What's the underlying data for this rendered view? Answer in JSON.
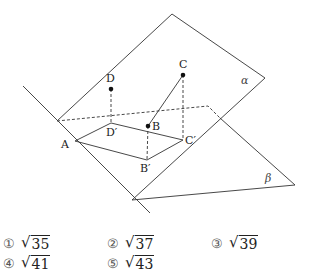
{
  "figure": {
    "planes": [
      {
        "name": "alpha",
        "label": "α"
      },
      {
        "name": "beta",
        "label": "β"
      }
    ],
    "points": [
      {
        "name": "A",
        "label": "A"
      },
      {
        "name": "B",
        "label": "B"
      },
      {
        "name": "C",
        "label": "C"
      },
      {
        "name": "D",
        "label": "D"
      },
      {
        "name": "B-prime",
        "label": "B′"
      },
      {
        "name": "C-prime",
        "label": "C′"
      },
      {
        "name": "D-prime",
        "label": "D′"
      }
    ]
  },
  "options": [
    {
      "number": "①",
      "radicand": "35"
    },
    {
      "number": "②",
      "radicand": "37"
    },
    {
      "number": "③",
      "radicand": "39"
    },
    {
      "number": "④",
      "radicand": "41"
    },
    {
      "number": "⑤",
      "radicand": "43"
    }
  ]
}
